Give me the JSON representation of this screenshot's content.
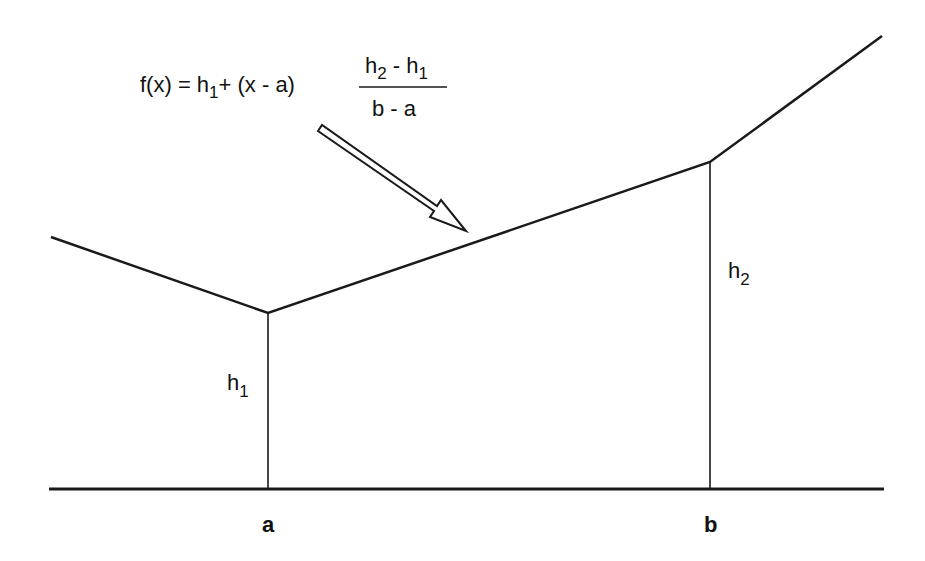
{
  "diagram": {
    "type": "piecewise-linear-interpolation",
    "stroke_color": "#111111",
    "background": "#ffffff",
    "formula": {
      "lhs": "f(x) = h",
      "lhs_sub": "1",
      "plus": "+ (x - a)",
      "numerator_h2": "h",
      "numerator_h2_sub": "2",
      "numerator_minus": " - h",
      "numerator_h1_sub": "1",
      "denominator": "b - a"
    },
    "labels": {
      "a": "a",
      "b": "b",
      "h1": "h",
      "h1_sub": "1",
      "h2": "h",
      "h2_sub": "2"
    },
    "points": {
      "left_end": [
        51,
        237
      ],
      "vertex_a": [
        268,
        313
      ],
      "vertex_b": [
        710,
        162
      ],
      "right_end": [
        882,
        36
      ]
    },
    "baseline": {
      "y": 489,
      "x_start": 49,
      "x_end": 884
    },
    "arrow": {
      "tail": [
        318,
        128
      ],
      "tip": [
        464,
        230
      ]
    }
  }
}
